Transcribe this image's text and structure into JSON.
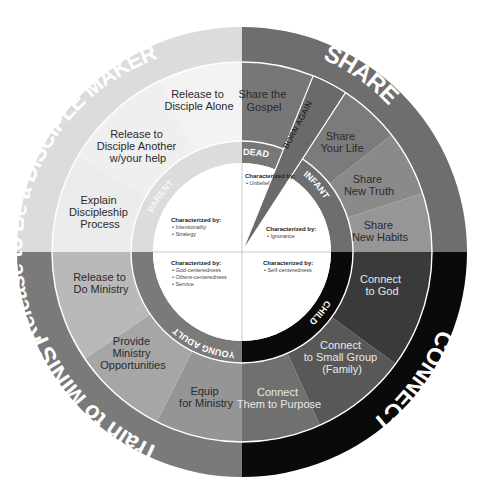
{
  "diagram": {
    "center": [
      242,
      252
    ],
    "radii": {
      "outer": 225,
      "middle": 190,
      "stage": 111,
      "core": 89
    },
    "quadrants": [
      {
        "id": "share",
        "outer_label": "SHARE",
        "outer_color": "#6e6e6e",
        "stage": {
          "label": "INFANT",
          "color": "#6e6e6e"
        },
        "segments": [
          {
            "label_lines": [
              "Share",
              "Your Life"
            ],
            "color": "#7b7b7b"
          },
          {
            "label_lines": [
              "Share",
              "New Truth"
            ],
            "color": "#8a8a8a"
          },
          {
            "label_lines": [
              "Share",
              "New Habits"
            ],
            "color": "#969696"
          }
        ],
        "characterized": {
          "title": "Characterized by:",
          "items": [
            "• Ignorance"
          ]
        }
      },
      {
        "id": "connect",
        "outer_label": "CONNECT",
        "outer_color": "#0a0a0a",
        "stage": {
          "label": "CHILD",
          "color": "#0a0a0a"
        },
        "segments": [
          {
            "label_lines": [
              "Connect",
              "to God"
            ],
            "color": "#3a3a3a"
          },
          {
            "label_lines": [
              "Connect",
              "to Small Group",
              "(Family)"
            ],
            "color": "#585858"
          },
          {
            "label_lines": [
              "Connect",
              "Them to Purpose"
            ],
            "color": "#707070"
          }
        ],
        "characterized": {
          "title": "Characterized by:",
          "items": [
            "• Self-centeredness"
          ]
        }
      },
      {
        "id": "train",
        "outer_label": "Train to MINISTER",
        "outer_color": "#7a7a7a",
        "stage": {
          "label": "YOUNG ADULT",
          "color": "#7a7a7a"
        },
        "segments": [
          {
            "label_lines": [
              "Equip",
              "for Ministry"
            ],
            "color": "#959595"
          },
          {
            "label_lines": [
              "Provide",
              "Ministry",
              "Opportunities"
            ],
            "color": "#a6a6a6"
          },
          {
            "label_lines": [
              "Release to",
              "Do Ministry"
            ],
            "color": "#b9b9b9"
          }
        ],
        "characterized": {
          "title": "Characterized by:",
          "items": [
            "• God-centeredness",
            "• Others-centeredness",
            "• Service"
          ]
        }
      },
      {
        "id": "release",
        "outer_label": "Release to Be a DISCIPLE MAKER",
        "outer_color": "#dcdcdc",
        "stage": {
          "label": "PARENT",
          "color": "#dcdcdc"
        },
        "segments": [
          {
            "label_lines": [
              "Explain",
              "Discipleship",
              "Process"
            ],
            "color": "#ececec"
          },
          {
            "label_lines": [
              "Release to",
              "Disciple Another",
              "w/your help"
            ],
            "color": "#f0f0f0"
          },
          {
            "label_lines": [
              "Release to",
              "Disciple Alone"
            ],
            "color": "#f3f3f3"
          }
        ],
        "characterized": {
          "title": "Characterized by:",
          "items": [
            "• Intentionality",
            "• Strategy"
          ]
        }
      }
    ],
    "dead": {
      "stage_label": "DEAD",
      "segment_label_lines": [
        "Share the",
        "Gospel"
      ],
      "segment_color": "#777777",
      "characterized": {
        "title": "Characterized by:",
        "items": [
          "• Unbelief"
        ]
      }
    },
    "born_again": {
      "label": "BORN AGAIN",
      "color": "#6a6a6a"
    }
  }
}
